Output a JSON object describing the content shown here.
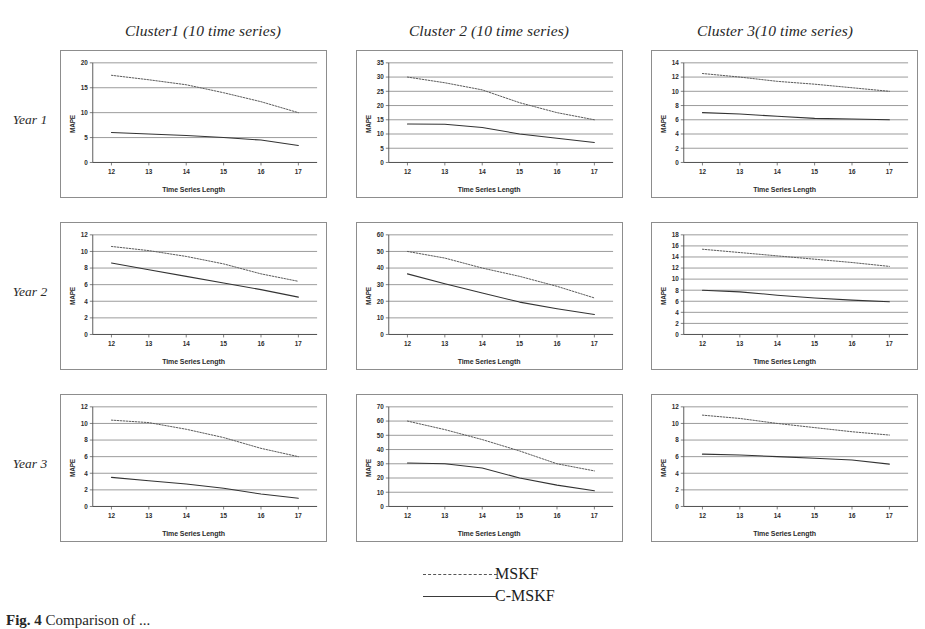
{
  "figure": {
    "caption_prefix": "Fig. 4",
    "caption_text": "Comparison of ...",
    "axis": {
      "xlabel": "Time Series Length",
      "ylabel": "MAPE"
    }
  },
  "columns": [
    {
      "title": "Cluster1 (10 time series)"
    },
    {
      "title": "Cluster 2 (10 time series)"
    },
    {
      "title": "Cluster 3(10 time series)"
    }
  ],
  "rows": [
    {
      "label": "Year 1"
    },
    {
      "label": "Year 2"
    },
    {
      "label": "Year 3"
    }
  ],
  "legend": {
    "position": "bottom-center",
    "items": [
      {
        "label": "MSKF",
        "style": "dashed",
        "color": "#555555"
      },
      {
        "label": "C-MSKF",
        "style": "solid",
        "color": "#3a3a3a"
      }
    ]
  },
  "chart_data": [
    {
      "id": "year1-cluster1",
      "type": "line",
      "title": "Cluster1 (10 time series)",
      "row": "Year 1",
      "xlabel": "Time Series Length",
      "ylabel": "MAPE",
      "grid": true,
      "x": [
        12,
        13,
        14,
        15,
        16,
        17
      ],
      "xlim": [
        11.5,
        17.5
      ],
      "ylim": [
        0,
        20
      ],
      "yticks": [
        0,
        5,
        10,
        15,
        20
      ],
      "series": [
        {
          "name": "MSKF",
          "style": "dashed",
          "values": [
            17.5,
            16.6,
            15.6,
            14.0,
            12.2,
            10.0
          ]
        },
        {
          "name": "C-MSKF",
          "style": "solid",
          "values": [
            6.0,
            5.7,
            5.4,
            5.0,
            4.5,
            3.4
          ]
        }
      ]
    },
    {
      "id": "year1-cluster2",
      "type": "line",
      "title": "Cluster 2 (10 time series)",
      "row": "Year 1",
      "xlabel": "Time Series Length",
      "ylabel": "MAPE",
      "grid": true,
      "x": [
        12,
        13,
        14,
        15,
        16,
        17
      ],
      "xlim": [
        11.5,
        17.5
      ],
      "ylim": [
        0,
        35
      ],
      "yticks": [
        0,
        5,
        10,
        15,
        20,
        25,
        30,
        35
      ],
      "series": [
        {
          "name": "MSKF",
          "style": "dashed",
          "values": [
            30.0,
            28.0,
            25.5,
            21.0,
            17.5,
            15.0
          ]
        },
        {
          "name": "C-MSKF",
          "style": "solid",
          "values": [
            13.5,
            13.4,
            12.3,
            10.0,
            8.5,
            7.0
          ]
        }
      ]
    },
    {
      "id": "year1-cluster3",
      "type": "line",
      "title": "Cluster 3(10 time series)",
      "row": "Year 1",
      "xlabel": "Time Series Length",
      "ylabel": "MAPE",
      "grid": true,
      "x": [
        12,
        13,
        14,
        15,
        16,
        17
      ],
      "xlim": [
        11.5,
        17.5
      ],
      "ylim": [
        0,
        14
      ],
      "yticks": [
        0,
        2,
        4,
        6,
        8,
        10,
        12,
        14
      ],
      "series": [
        {
          "name": "MSKF",
          "style": "dashed",
          "values": [
            12.5,
            12.0,
            11.4,
            11.0,
            10.5,
            10.0
          ]
        },
        {
          "name": "C-MSKF",
          "style": "solid",
          "values": [
            7.0,
            6.8,
            6.5,
            6.2,
            6.1,
            6.0
          ]
        }
      ]
    },
    {
      "id": "year2-cluster1",
      "type": "line",
      "title": "Cluster1 (10 time series)",
      "row": "Year 2",
      "xlabel": "Time Series Length",
      "ylabel": "MAPE",
      "grid": true,
      "x": [
        12,
        13,
        14,
        15,
        16,
        17
      ],
      "xlim": [
        11.5,
        17.5
      ],
      "ylim": [
        0,
        12
      ],
      "yticks": [
        0,
        2,
        4,
        6,
        8,
        10,
        12
      ],
      "series": [
        {
          "name": "MSKF",
          "style": "dashed",
          "values": [
            10.6,
            10.1,
            9.4,
            8.5,
            7.3,
            6.4
          ]
        },
        {
          "name": "C-MSKF",
          "style": "solid",
          "values": [
            8.6,
            7.8,
            7.0,
            6.2,
            5.4,
            4.5
          ]
        }
      ]
    },
    {
      "id": "year2-cluster2",
      "type": "line",
      "title": "Cluster 2 (10 time series)",
      "row": "Year 2",
      "xlabel": "Time Series Length",
      "ylabel": "MAPE",
      "grid": true,
      "x": [
        12,
        13,
        14,
        15,
        16,
        17
      ],
      "xlim": [
        11.5,
        17.5
      ],
      "ylim": [
        0,
        60
      ],
      "yticks": [
        0,
        10,
        20,
        30,
        40,
        50,
        60
      ],
      "series": [
        {
          "name": "MSKF",
          "style": "dashed",
          "values": [
            50.0,
            46.0,
            40.0,
            35.0,
            29.0,
            22.0
          ]
        },
        {
          "name": "C-MSKF",
          "style": "solid",
          "values": [
            36.5,
            30.5,
            25.0,
            19.5,
            15.5,
            12.0
          ]
        }
      ]
    },
    {
      "id": "year2-cluster3",
      "type": "line",
      "title": "Cluster 3(10 time series)",
      "row": "Year 2",
      "xlabel": "Time Series Length",
      "ylabel": "MAPE",
      "grid": true,
      "x": [
        12,
        13,
        14,
        15,
        16,
        17
      ],
      "xlim": [
        11.5,
        17.5
      ],
      "ylim": [
        0,
        18
      ],
      "yticks": [
        0,
        2,
        4,
        6,
        8,
        10,
        12,
        14,
        16,
        18
      ],
      "series": [
        {
          "name": "MSKF",
          "style": "dashed",
          "values": [
            15.4,
            14.8,
            14.2,
            13.6,
            13.0,
            12.3
          ]
        },
        {
          "name": "C-MSKF",
          "style": "solid",
          "values": [
            8.0,
            7.7,
            7.1,
            6.6,
            6.2,
            5.9
          ]
        }
      ]
    },
    {
      "id": "year3-cluster1",
      "type": "line",
      "title": "Cluster1 (10 time series)",
      "row": "Year 3",
      "xlabel": "Time Series Length",
      "ylabel": "MAPE",
      "grid": true,
      "x": [
        12,
        13,
        14,
        15,
        16,
        17
      ],
      "xlim": [
        11.5,
        17.5
      ],
      "ylim": [
        0,
        12
      ],
      "yticks": [
        0,
        2,
        4,
        6,
        8,
        10,
        12
      ],
      "series": [
        {
          "name": "MSKF",
          "style": "dashed",
          "values": [
            10.4,
            10.1,
            9.3,
            8.3,
            7.0,
            6.0
          ]
        },
        {
          "name": "C-MSKF",
          "style": "solid",
          "values": [
            3.5,
            3.1,
            2.7,
            2.2,
            1.5,
            1.0
          ]
        }
      ]
    },
    {
      "id": "year3-cluster2",
      "type": "line",
      "title": "Cluster 2 (10 time series)",
      "row": "Year 3",
      "xlabel": "Time Series Length",
      "ylabel": "MAPE",
      "grid": true,
      "x": [
        12,
        13,
        14,
        15,
        16,
        17
      ],
      "xlim": [
        11.5,
        17.5
      ],
      "ylim": [
        0,
        70
      ],
      "yticks": [
        0,
        10,
        20,
        30,
        40,
        50,
        60,
        70
      ],
      "series": [
        {
          "name": "MSKF",
          "style": "dashed",
          "values": [
            60.0,
            54.0,
            47.0,
            39.0,
            30.0,
            25.0
          ]
        },
        {
          "name": "C-MSKF",
          "style": "solid",
          "values": [
            30.5,
            30.0,
            27.0,
            20.0,
            15.0,
            11.0
          ]
        }
      ]
    },
    {
      "id": "year3-cluster3",
      "type": "line",
      "title": "Cluster 3(10 time series)",
      "row": "Year 3",
      "xlabel": "Time Series Length",
      "ylabel": "MAPE",
      "grid": true,
      "x": [
        12,
        13,
        14,
        15,
        16,
        17
      ],
      "xlim": [
        11.5,
        17.5
      ],
      "ylim": [
        0,
        12
      ],
      "yticks": [
        0,
        2,
        4,
        6,
        8,
        10,
        12
      ],
      "series": [
        {
          "name": "MSKF",
          "style": "dashed",
          "values": [
            11.0,
            10.6,
            10.0,
            9.5,
            9.0,
            8.6
          ]
        },
        {
          "name": "C-MSKF",
          "style": "solid",
          "values": [
            6.3,
            6.2,
            6.0,
            5.8,
            5.6,
            5.1
          ]
        }
      ]
    }
  ]
}
